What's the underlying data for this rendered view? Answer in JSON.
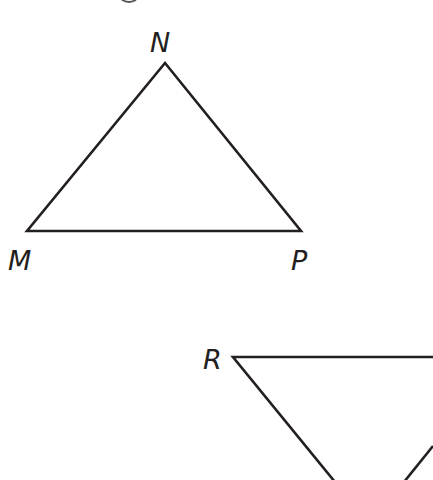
{
  "diagram": {
    "stroke_color": "#231f20",
    "background": "#ffffff",
    "triangles": [
      {
        "name": "MNP",
        "vertices": {
          "N": {
            "label": "N",
            "x": 165,
            "y": 63
          },
          "M": {
            "label": "M",
            "x": 27,
            "y": 231
          },
          "P": {
            "label": "P",
            "x": 301,
            "y": 231
          }
        }
      },
      {
        "name": "R-triangle (partially visible)",
        "vertices": {
          "R": {
            "label": "R",
            "x": 233,
            "y": 357
          }
        }
      }
    ],
    "labels": {
      "N": "N",
      "M": "M",
      "P": "P",
      "R": "R"
    }
  }
}
